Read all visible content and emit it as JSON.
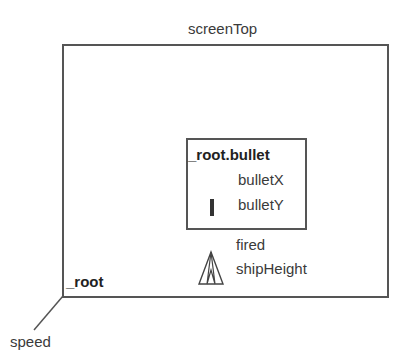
{
  "diagram": {
    "screen_top_label": "screenTop",
    "root_label": "_root",
    "speed_label": "speed",
    "bullet": {
      "title": "_root.bullet",
      "x_label": "bulletX",
      "y_label": "bulletY"
    },
    "ship": {
      "fired_label": "fired",
      "height_label": "shipHeight"
    }
  }
}
